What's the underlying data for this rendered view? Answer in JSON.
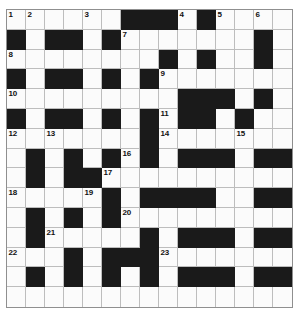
{
  "puzzle": {
    "title": "Crossword Grid",
    "type": "crossword",
    "rows": 15,
    "cols": 15,
    "colors": {
      "block": "#1a1a1a",
      "open": "#fbfbfb",
      "grid_line": "#bdbdbd",
      "border": "#8f8f8f",
      "number_text": "#111111",
      "page_background": "#ffffff"
    },
    "cell_size_px": 19,
    "grid_origin_px": {
      "x": 6,
      "y": 9
    },
    "clue_number_count": 23,
    "clue_numbers": [
      1,
      2,
      3,
      4,
      5,
      6,
      7,
      8,
      9,
      10,
      11,
      12,
      13,
      14,
      15,
      16,
      17,
      18,
      19,
      20,
      21,
      22,
      23
    ],
    "grid": [
      [
        "W",
        "W",
        "W",
        "W",
        "W",
        "W",
        "B",
        "B",
        "B",
        "W",
        "B",
        "W",
        "W",
        "W",
        "W"
      ],
      [
        "B",
        "W",
        "B",
        "B",
        "W",
        "B",
        "W",
        "W",
        "W",
        "W",
        "W",
        "W",
        "W",
        "B",
        "W"
      ],
      [
        "W",
        "W",
        "W",
        "W",
        "W",
        "W",
        "W",
        "W",
        "B",
        "W",
        "B",
        "W",
        "W",
        "B",
        "W"
      ],
      [
        "B",
        "W",
        "B",
        "B",
        "W",
        "B",
        "W",
        "B",
        "W",
        "W",
        "W",
        "W",
        "W",
        "W",
        "W"
      ],
      [
        "W",
        "W",
        "W",
        "W",
        "W",
        "W",
        "W",
        "W",
        "W",
        "B",
        "B",
        "B",
        "W",
        "B",
        "W"
      ],
      [
        "B",
        "W",
        "B",
        "B",
        "W",
        "B",
        "W",
        "B",
        "W",
        "B",
        "B",
        "W",
        "B",
        "W",
        "W"
      ],
      [
        "W",
        "W",
        "W",
        "W",
        "W",
        "W",
        "W",
        "B",
        "W",
        "W",
        "W",
        "W",
        "W",
        "W",
        "W"
      ],
      [
        "W",
        "B",
        "W",
        "B",
        "W",
        "B",
        "W",
        "B",
        "W",
        "B",
        "B",
        "B",
        "W",
        "B",
        "B"
      ],
      [
        "W",
        "B",
        "W",
        "B",
        "B",
        "W",
        "W",
        "W",
        "W",
        "W",
        "W",
        "W",
        "W",
        "W",
        "W"
      ],
      [
        "W",
        "W",
        "W",
        "W",
        "W",
        "B",
        "W",
        "B",
        "B",
        "B",
        "B",
        "W",
        "W",
        "B",
        "B"
      ],
      [
        "W",
        "B",
        "W",
        "B",
        "W",
        "B",
        "W",
        "W",
        "W",
        "W",
        "W",
        "W",
        "W",
        "W",
        "W"
      ],
      [
        "W",
        "B",
        "W",
        "W",
        "W",
        "W",
        "W",
        "B",
        "W",
        "B",
        "B",
        "B",
        "W",
        "B",
        "B"
      ],
      [
        "W",
        "W",
        "W",
        "B",
        "W",
        "B",
        "B",
        "B",
        "W",
        "W",
        "W",
        "W",
        "W",
        "W",
        "W"
      ],
      [
        "W",
        "B",
        "W",
        "B",
        "W",
        "B",
        "W",
        "B",
        "W",
        "B",
        "B",
        "B",
        "W",
        "B",
        "B"
      ],
      [
        "W",
        "W",
        "W",
        "W",
        "W",
        "W",
        "W",
        "W",
        "W",
        "W",
        "W",
        "W",
        "W",
        "W",
        "W"
      ]
    ],
    "numbered_cells": [
      {
        "number": 1,
        "row": 1,
        "col": 1
      },
      {
        "number": 2,
        "row": 1,
        "col": 2
      },
      {
        "number": 3,
        "row": 1,
        "col": 5
      },
      {
        "number": 4,
        "row": 1,
        "col": 10
      },
      {
        "number": 5,
        "row": 1,
        "col": 12
      },
      {
        "number": 6,
        "row": 1,
        "col": 14
      },
      {
        "number": 7,
        "row": 2,
        "col": 7
      },
      {
        "number": 8,
        "row": 3,
        "col": 1
      },
      {
        "number": 9,
        "row": 4,
        "col": 9
      },
      {
        "number": 10,
        "row": 5,
        "col": 1
      },
      {
        "number": 11,
        "row": 6,
        "col": 9
      },
      {
        "number": 12,
        "row": 7,
        "col": 1
      },
      {
        "number": 13,
        "row": 7,
        "col": 3
      },
      {
        "number": 14,
        "row": 7,
        "col": 9
      },
      {
        "number": 15,
        "row": 7,
        "col": 13
      },
      {
        "number": 16,
        "row": 8,
        "col": 7
      },
      {
        "number": 17,
        "row": 9,
        "col": 6
      },
      {
        "number": 18,
        "row": 10,
        "col": 1
      },
      {
        "number": 19,
        "row": 10,
        "col": 5
      },
      {
        "number": 20,
        "row": 11,
        "col": 7
      },
      {
        "number": 21,
        "row": 12,
        "col": 3
      },
      {
        "number": 22,
        "row": 13,
        "col": 1
      },
      {
        "number": 23,
        "row": 13,
        "col": 9
      }
    ]
  }
}
